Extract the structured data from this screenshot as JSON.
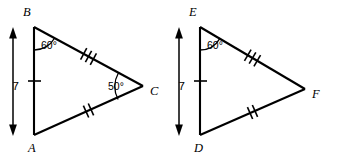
{
  "figure": {
    "background_color": "#ffffff",
    "stroke_color": "#000000",
    "width": 337,
    "height": 158
  },
  "triangles": [
    {
      "id": "abc",
      "name": "triangle-abc",
      "vertices": [
        {
          "key": "B",
          "label": "B",
          "x": 34,
          "y": 27,
          "label_x": 23,
          "label_y": 16
        },
        {
          "key": "A",
          "label": "A",
          "x": 34,
          "y": 135,
          "label_x": 28,
          "label_y": 152
        },
        {
          "key": "C",
          "label": "C",
          "x": 143,
          "y": 86,
          "label_x": 150,
          "label_y": 95
        }
      ],
      "angles": [
        {
          "at": "B",
          "label": "60°",
          "label_x": 41,
          "label_y": 49
        },
        {
          "at": "C",
          "label": "50°",
          "label_x": 108,
          "label_y": 90
        }
      ],
      "sides": [
        {
          "from": "B",
          "to": "C",
          "ticks": 3,
          "name": "side-bc"
        },
        {
          "from": "A",
          "to": "C",
          "ticks": 2,
          "name": "side-ac"
        },
        {
          "from": "B",
          "to": "A",
          "ticks": 1,
          "name": "side-ab"
        }
      ],
      "dimension": {
        "label": "7",
        "label_x": 8,
        "label_y": 86,
        "x": 13,
        "y_top": 30,
        "y_bottom": 133
      }
    },
    {
      "id": "def",
      "name": "triangle-def",
      "vertices": [
        {
          "key": "E",
          "label": "E",
          "x": 200,
          "y": 27,
          "label_x": 189,
          "label_y": 16
        },
        {
          "key": "D",
          "label": "D",
          "x": 200,
          "y": 135,
          "label_x": 194,
          "label_y": 152
        },
        {
          "key": "F",
          "label": "F",
          "x": 305,
          "y": 89,
          "label_x": 312,
          "label_y": 98
        }
      ],
      "angles": [
        {
          "at": "E",
          "label": "60°",
          "label_x": 207,
          "label_y": 49
        }
      ],
      "sides": [
        {
          "from": "E",
          "to": "F",
          "ticks": 3,
          "name": "side-ef"
        },
        {
          "from": "D",
          "to": "F",
          "ticks": 2,
          "name": "side-df"
        },
        {
          "from": "E",
          "to": "D",
          "ticks": 1,
          "name": "side-ed"
        }
      ],
      "dimension": {
        "label": "7",
        "label_x": 174,
        "label_y": 86,
        "x": 179,
        "y_top": 30,
        "y_bottom": 133
      }
    }
  ]
}
